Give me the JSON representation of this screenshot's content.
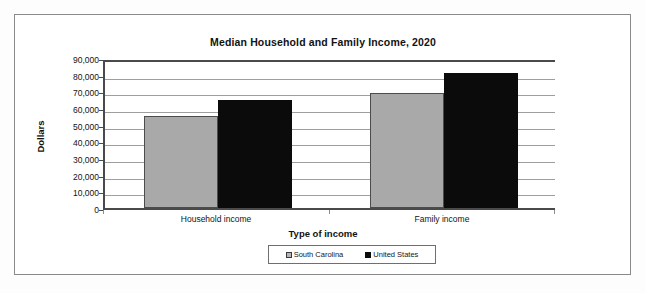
{
  "chart_data": {
    "type": "bar",
    "title": "Median Household and Family Income, 2020",
    "xlabel": "Type of income",
    "ylabel": "Dollars",
    "categories": [
      "Household income",
      "Family income"
    ],
    "series": [
      {
        "name": "South Carolina",
        "color": "#a9a9a9",
        "values": [
          55000,
          69000
        ]
      },
      {
        "name": "United States",
        "color": "#0b0b0b",
        "values": [
          65000,
          81000
        ]
      }
    ],
    "ylim": [
      0,
      90000
    ],
    "ytick_values": [
      90000,
      80000,
      70000,
      60000,
      50000,
      40000,
      30000,
      20000,
      10000,
      0
    ],
    "ytick_labels": [
      "90,000",
      "80,000",
      "70,000",
      "60,000",
      "50,000",
      "40,000",
      "30,000",
      "20,000",
      "10,000",
      "0"
    ],
    "grid": true,
    "legend_position": "bottom"
  },
  "legend": {
    "entries": [
      {
        "label": "South Carolina"
      },
      {
        "label": "United States"
      }
    ]
  }
}
